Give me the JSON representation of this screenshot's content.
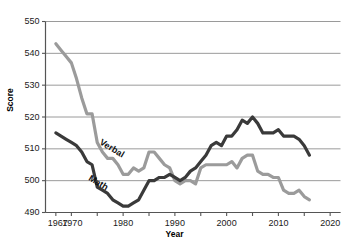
{
  "chart_data": {
    "type": "line",
    "title": "",
    "xlabel": "Year",
    "ylabel": "Score",
    "xlim": [
      1965,
      2022
    ],
    "ylim": [
      490,
      550
    ],
    "grid": true,
    "grid_axis": "y",
    "legend": "inline-labels",
    "xticks_labeled": [
      "1967",
      "1970",
      "1980",
      "1990",
      "2000",
      "2010",
      "2020"
    ],
    "xtick_values": [
      1967,
      1970,
      1980,
      1990,
      2000,
      2010,
      2020
    ],
    "xticks_minor": [
      1970,
      1975,
      1980,
      1985,
      1990,
      1995,
      2000,
      2005,
      2010,
      2015,
      2020
    ],
    "yticks": [
      "490",
      "500",
      "510",
      "520",
      "530",
      "540",
      "550"
    ],
    "ytick_values": [
      490,
      500,
      510,
      520,
      530,
      540,
      550
    ],
    "series": [
      {
        "name": "Verbal",
        "color": "#9b9b9b",
        "label_text": "Verbal",
        "x": [
          1967,
          1968,
          1969,
          1970,
          1971,
          1972,
          1973,
          1974,
          1975,
          1976,
          1977,
          1978,
          1979,
          1980,
          1981,
          1982,
          1983,
          1984,
          1985,
          1986,
          1987,
          1988,
          1989,
          1990,
          1991,
          1992,
          1993,
          1994,
          1995,
          1996,
          1997,
          1998,
          1999,
          2000,
          2001,
          2002,
          2003,
          2004,
          2005,
          2006,
          2007,
          2008,
          2009,
          2010,
          2011,
          2012,
          2013,
          2014,
          2015,
          2016
        ],
        "values": [
          543,
          541,
          539,
          537,
          532,
          526,
          521,
          521,
          512,
          509,
          507,
          507,
          505,
          502,
          502,
          504,
          503,
          504,
          509,
          509,
          507,
          505,
          504,
          500,
          499,
          500,
          500,
          499,
          504,
          505,
          505,
          505,
          505,
          505,
          506,
          504,
          507,
          508,
          508,
          503,
          502,
          502,
          501,
          501,
          497,
          496,
          496,
          497,
          495,
          494
        ]
      },
      {
        "name": "Math",
        "color": "#3a3a3a",
        "label_text": "Math",
        "x": [
          1967,
          1968,
          1969,
          1970,
          1971,
          1972,
          1973,
          1974,
          1975,
          1976,
          1977,
          1978,
          1979,
          1980,
          1981,
          1982,
          1983,
          1984,
          1985,
          1986,
          1987,
          1988,
          1989,
          1990,
          1991,
          1992,
          1993,
          1994,
          1995,
          1996,
          1997,
          1998,
          1999,
          2000,
          2001,
          2002,
          2003,
          2004,
          2005,
          2006,
          2007,
          2008,
          2009,
          2010,
          2011,
          2012,
          2013,
          2014,
          2015,
          2016
        ],
        "values": [
          515,
          514,
          513,
          512,
          511,
          509,
          506,
          505,
          498,
          497,
          496,
          494,
          493,
          492,
          492,
          493,
          494,
          497,
          500,
          500,
          501,
          501,
          502,
          501,
          500,
          501,
          503,
          504,
          506,
          508,
          511,
          512,
          511,
          514,
          514,
          516,
          519,
          518,
          520,
          518,
          515,
          515,
          515,
          516,
          514,
          514,
          514,
          513,
          511,
          508
        ]
      }
    ]
  },
  "axis": {
    "ylabel": "Score",
    "xlabel": "Year",
    "title_remnant": ""
  }
}
